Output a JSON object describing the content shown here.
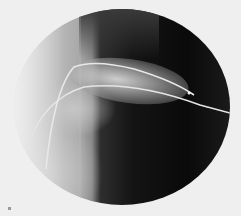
{
  "image": {
    "kind": "fluoroscopy-angiogram",
    "description": "Circular X-ray fluoroscopic field showing two catheters/guidewires curving from left into a contrast-filled vessel on a dark background",
    "colors": {
      "background": "#efefef",
      "dark_field": "#0a0a0a",
      "bright_contrast": "#d7d7d7",
      "catheter": "#e6e6e6"
    }
  }
}
